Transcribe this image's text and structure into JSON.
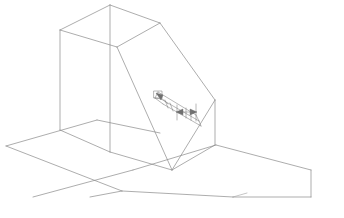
{
  "drawing": {
    "title": "Isometric wireframe solid with chamfered top and slotted recess",
    "type": "3d-wireframe-line-drawing",
    "projection": "isometric",
    "canvas": {
      "width": 344,
      "height": 218
    },
    "style": {
      "background_color": "#ffffff",
      "line_color": "#8a8a8a",
      "line_color_strong": "#6f6f6f",
      "line_color_light": "#a0a0a0",
      "line_width": 0.7
    },
    "parts": [
      {
        "name": "ground-plane",
        "label": "Ground plane",
        "vertices": [
          [
            6,
            146
          ],
          [
            97,
            120
          ],
          [
            216,
            145
          ],
          [
            310,
            170
          ],
          [
            310,
            196
          ],
          [
            222,
            196
          ],
          [
            118,
            196
          ]
        ]
      },
      {
        "name": "main-block",
        "label": "Rectangular block with chamfer",
        "vertices": {
          "top_back_left": [
            60,
            30
          ],
          "top_front_left": [
            110,
            5
          ],
          "top_apex": [
            160,
            23
          ],
          "chamfer_upper_right": [
            208,
            48
          ],
          "bottom_back_left": [
            60,
            130
          ],
          "bottom_front_left": [
            110,
            152
          ],
          "bottom_front_right": [
            172,
            170
          ],
          "right_lower": [
            215,
            145
          ],
          "right_upper": [
            215,
            100
          ]
        }
      },
      {
        "name": "chamfer-face",
        "label": "Inclined chamfer face"
      },
      {
        "name": "slot-feature",
        "label": "Recessed slot with dimension arrows"
      }
    ],
    "annotations": {
      "dimension_arrows": [
        {
          "name": "slot-depth-arrow",
          "direction": "up-left"
        },
        {
          "name": "slot-width-arrow",
          "direction": "right"
        }
      ]
    }
  }
}
